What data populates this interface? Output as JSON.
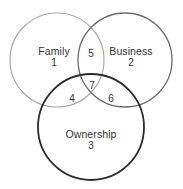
{
  "diagram": {
    "background_color": "#ffffff",
    "text_color": "#333333",
    "sets": [
      {
        "id": "family",
        "label": "Family",
        "number": "1",
        "stroke_color": "#a9a9a9",
        "stroke_width": 1.2,
        "cx": 57,
        "cy": 60,
        "r": 47,
        "label_x": 54,
        "label_y": 57
      },
      {
        "id": "business",
        "label": "Business",
        "number": "2",
        "stroke_color": "#6b6b6b",
        "stroke_width": 1.3,
        "cx": 125,
        "cy": 60,
        "r": 47,
        "label_x": 131,
        "label_y": 57
      },
      {
        "id": "ownership",
        "label": "Ownership",
        "number": "3",
        "stroke_color": "#2b2b2b",
        "stroke_width": 1.8,
        "cx": 91,
        "cy": 127,
        "r": 53,
        "label_x": 91,
        "label_y": 140
      }
    ],
    "intersections": [
      {
        "id": "family-ownership",
        "number": "4",
        "x": 72,
        "y": 98
      },
      {
        "id": "family-business",
        "number": "5",
        "x": 91,
        "y": 53
      },
      {
        "id": "business-ownership",
        "number": "6",
        "x": 111,
        "y": 98
      },
      {
        "id": "family-business-ownership",
        "number": "7",
        "x": 92,
        "y": 85
      }
    ]
  }
}
